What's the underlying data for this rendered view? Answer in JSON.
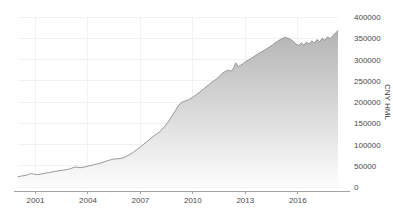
{
  "chart_data": {
    "type": "area",
    "title": "",
    "subtitle": "",
    "xlabel": "",
    "ylabel": "CNY HML",
    "ylim": [
      0,
      400000
    ],
    "xlim": [
      2000.0,
      2018.3
    ],
    "grid": true,
    "legend": false,
    "legend_position": "none",
    "y_ticks": [
      0,
      50000,
      100000,
      150000,
      200000,
      250000,
      300000,
      350000,
      400000
    ],
    "y_tick_labels": [
      "0",
      "50000",
      "100000",
      "150000",
      "200000",
      "250000",
      "300000",
      "350000",
      "400000"
    ],
    "y_axis_side": "right",
    "x_ticks": [
      2001,
      2004,
      2007,
      2010,
      2013,
      2016
    ],
    "x_tick_labels": [
      "2001",
      "2004",
      "2007",
      "2010",
      "2013",
      "2016"
    ],
    "series": [
      {
        "name": "CNY HML",
        "line_color": "#8c8c8c",
        "fill_top_color": "#b4b4b4",
        "fill_bottom_color": "#fdfdfd",
        "x": [
          2000.0,
          2000.15,
          2000.3,
          2000.45,
          2000.6,
          2000.75,
          2000.9,
          2001.05,
          2001.2,
          2001.35,
          2001.5,
          2001.65,
          2001.8,
          2001.95,
          2002.1,
          2002.25,
          2002.4,
          2002.55,
          2002.7,
          2002.85,
          2003.0,
          2003.15,
          2003.3,
          2003.45,
          2003.6,
          2003.75,
          2003.9,
          2004.05,
          2004.2,
          2004.35,
          2004.5,
          2004.65,
          2004.8,
          2004.95,
          2005.1,
          2005.25,
          2005.4,
          2005.55,
          2005.7,
          2005.85,
          2006.0,
          2006.15,
          2006.3,
          2006.45,
          2006.6,
          2006.75,
          2006.9,
          2007.05,
          2007.2,
          2007.35,
          2007.5,
          2007.65,
          2007.8,
          2007.95,
          2008.1,
          2008.25,
          2008.4,
          2008.55,
          2008.7,
          2008.85,
          2009.0,
          2009.15,
          2009.3,
          2009.45,
          2009.6,
          2009.75,
          2009.9,
          2010.05,
          2010.2,
          2010.35,
          2010.5,
          2010.65,
          2010.8,
          2010.95,
          2011.1,
          2011.25,
          2011.4,
          2011.55,
          2011.7,
          2011.85,
          2012.0,
          2012.15,
          2012.3,
          2012.45,
          2012.6,
          2012.75,
          2012.9,
          2013.05,
          2013.2,
          2013.35,
          2013.5,
          2013.65,
          2013.8,
          2013.95,
          2014.1,
          2014.25,
          2014.4,
          2014.55,
          2014.7,
          2014.85,
          2015.0,
          2015.15,
          2015.3,
          2015.45,
          2015.6,
          2015.75,
          2015.9,
          2016.05,
          2016.2,
          2016.35,
          2016.5,
          2016.65,
          2016.8,
          2016.95,
          2017.1,
          2017.25,
          2017.4,
          2017.55,
          2017.7,
          2017.85,
          2018.0,
          2018.15,
          2018.3
        ],
        "values": [
          24000,
          25500,
          26500,
          27500,
          29500,
          31500,
          30500,
          29000,
          29500,
          30500,
          32000,
          33000,
          34000,
          35500,
          36500,
          37500,
          38500,
          39500,
          40500,
          41500,
          43000,
          45500,
          47000,
          46000,
          45500,
          46500,
          48000,
          49500,
          51000,
          52500,
          54000,
          55500,
          57500,
          59500,
          61500,
          63500,
          65000,
          66000,
          66500,
          67000,
          68500,
          71000,
          74500,
          78000,
          82000,
          86500,
          91000,
          96000,
          101000,
          106000,
          111000,
          116500,
          121000,
          125500,
          130000,
          136000,
          143000,
          151000,
          160000,
          170000,
          180000,
          190000,
          197000,
          201000,
          203000,
          205500,
          209000,
          213000,
          217500,
          222000,
          227000,
          232000,
          237000,
          242000,
          247000,
          251000,
          256000,
          262000,
          268000,
          272000,
          275000,
          273000,
          277000,
          292000,
          283000,
          287000,
          291000,
          296000,
          299000,
          303000,
          307000,
          311000,
          315000,
          318000,
          322000,
          326000,
          330000,
          334000,
          339000,
          343000,
          347000,
          350000,
          352000,
          350000,
          347000,
          342000,
          336000,
          333000,
          339000,
          334000,
          341000,
          336000,
          344000,
          339000,
          347000,
          342000,
          350000,
          345000,
          353000,
          349000,
          356000,
          362000,
          368000
        ]
      }
    ]
  },
  "axis": {
    "y_title": "CNY HML"
  }
}
